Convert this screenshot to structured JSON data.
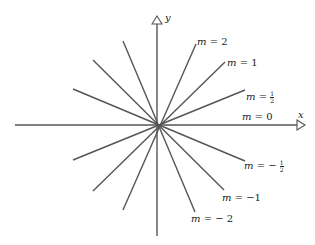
{
  "diagram": {
    "title": "",
    "axes": {
      "x_label": "x",
      "y_label": "y"
    },
    "origin": [
      157,
      125
    ],
    "colors": {
      "line": "#555555",
      "text": "#222222"
    },
    "lines": [
      {
        "slope": "2",
        "label": "m = 2"
      },
      {
        "slope": "1",
        "label": "m = 1"
      },
      {
        "slope": "1/2",
        "label": "m = 1/2"
      },
      {
        "slope": "0",
        "label": "m = 0"
      },
      {
        "slope": "-1/2",
        "label": "m = -1/2"
      },
      {
        "slope": "-1",
        "label": "m = -1"
      },
      {
        "slope": "-2",
        "label": "m = -2"
      }
    ]
  },
  "labels": {
    "x": "x",
    "y": "y",
    "m2_var": "m",
    "m2_val": " = 2",
    "m1_var": "m",
    "m1_val": " = 1",
    "mhalf_var": "m",
    "mhalf_eq": " = ",
    "mhalf_num": "1",
    "mhalf_den": "2",
    "m0_var": "m",
    "m0_val": " = 0",
    "mneghalf_var": "m",
    "mneghalf_eq": " = − ",
    "mneghalf_num": "1",
    "mneghalf_den": "2",
    "mneg1_var": "m",
    "mneg1_val": " = −1",
    "mneg2_var": "m",
    "mneg2_val": " = − 2"
  }
}
